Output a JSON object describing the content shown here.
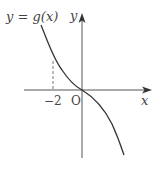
{
  "figure": {
    "function_label": "y = g(x)",
    "x_axis_label": "x",
    "y_axis_label": "y",
    "origin_label": "O",
    "x_tick_label": "−2",
    "colors": {
      "axis": "#555555",
      "curve": "#333333",
      "dashed": "#777777",
      "text": "#444444"
    }
  }
}
